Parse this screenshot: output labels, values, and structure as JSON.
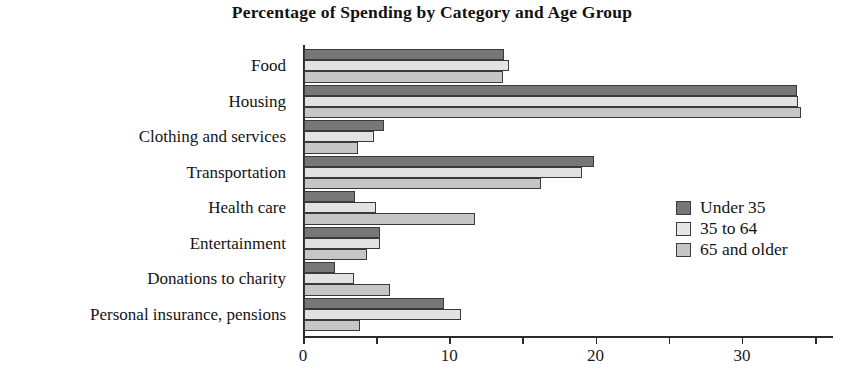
{
  "chart_data": {
    "type": "bar",
    "orientation": "horizontal",
    "title": "Percentage of Spending by Category and Age Group",
    "xlabel": "",
    "ylabel": "",
    "xlim": [
      0,
      36.2
    ],
    "grid": false,
    "legend_position": "middle-right",
    "x_ticks": [
      0,
      5,
      10,
      15,
      20,
      25,
      30,
      35
    ],
    "x_tick_labels": [
      "0",
      "",
      "10",
      "",
      "20",
      "",
      "30",
      ""
    ],
    "categories": [
      "Food",
      "Housing",
      "Clothing and services",
      "Transportation",
      "Health care",
      "Entertainment",
      "Donations to charity",
      "Personal insurance, pensions"
    ],
    "series": [
      {
        "name": "Under 35",
        "color": "#777777",
        "values": [
          13.7,
          33.7,
          5.5,
          19.8,
          3.5,
          5.2,
          2.1,
          9.6
        ]
      },
      {
        "name": "35 to 64",
        "color": "#e2e2e2",
        "values": [
          14.0,
          33.8,
          4.8,
          19.0,
          4.9,
          5.2,
          3.4,
          10.7
        ]
      },
      {
        "name": "65 and older",
        "color": "#c6c6c6",
        "values": [
          13.6,
          34.0,
          3.7,
          16.2,
          11.7,
          4.3,
          5.9,
          3.8
        ]
      }
    ]
  }
}
